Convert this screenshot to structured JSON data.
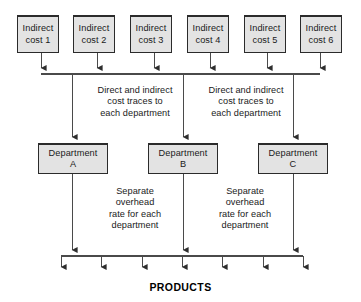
{
  "diagram": {
    "title": "PRODUCTS",
    "colors": {
      "box_fill": "#e3e3e3",
      "box_border": "#2b2b2b",
      "line": "#3a3a3a",
      "text": "#1a1a1a",
      "background": "#ffffff"
    },
    "cost_boxes": [
      {
        "label": "Indirect\ncost 1",
        "x": 17,
        "y": 15
      },
      {
        "label": "Indirect\ncost 2",
        "x": 73,
        "y": 15
      },
      {
        "label": "Indirect\ncost 3",
        "x": 130,
        "y": 15
      },
      {
        "label": "Indirect\ncost 4",
        "x": 187,
        "y": 15
      },
      {
        "label": "Indirect\ncost 5",
        "x": 244,
        "y": 15
      },
      {
        "label": "Indirect\ncost 6",
        "x": 300,
        "y": 15
      }
    ],
    "department_boxes": [
      {
        "label": "Department\nA",
        "x": 38,
        "y": 143
      },
      {
        "label": "Department\nB",
        "x": 148,
        "y": 143
      },
      {
        "label": "Department\nC",
        "x": 258,
        "y": 143
      }
    ],
    "trace_captions": [
      {
        "text": "Direct and indirect\ncost traces to\neach department",
        "x": 81,
        "y": 85
      },
      {
        "text": "Direct and indirect\ncost traces to\neach department",
        "x": 192,
        "y": 85
      }
    ],
    "rate_captions": [
      {
        "text": "Separate\noverhead\nrate for each\ndepartment",
        "x": 87,
        "y": 186
      },
      {
        "text": "Separate\noverhead\nrate for each\ndepartment",
        "x": 197,
        "y": 186
      }
    ],
    "top_bus": {
      "y": 74,
      "x1": 41,
      "x2": 320
    },
    "bottom_bus": {
      "y": 256,
      "x1": 61,
      "x2": 303
    },
    "cost_arrow_x": [
      41,
      97,
      154,
      210,
      267,
      320
    ],
    "dept_line_x": [
      72,
      183,
      293
    ],
    "product_arrow_x": [
      61,
      101,
      142,
      182,
      222,
      263,
      303
    ],
    "product_arrow_tip_y": 273
  }
}
